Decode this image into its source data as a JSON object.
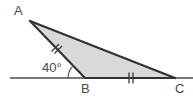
{
  "figure": {
    "kind": "geometry-diagram",
    "shape": "triangle",
    "width": 193,
    "height": 102,
    "background_color": "#ffffff",
    "fill_color": "#d9d9d9",
    "stroke_color": "#333333",
    "baseline_color": "#4d4d4d",
    "label_color": "#4a4a4a"
  },
  "labels": {
    "vertex_a": "A",
    "vertex_b": "B",
    "vertex_c": "C",
    "angle_b": "40°"
  },
  "vertices": {
    "a": {
      "x": 30,
      "y": 21
    },
    "b": {
      "x": 85,
      "y": 78
    },
    "c": {
      "x": 175,
      "y": 78
    }
  },
  "baseline": {
    "name": "horizontal-ray",
    "x_start": 10,
    "x_end": 193,
    "y": 78
  },
  "angle_arc": {
    "at_vertex": "B",
    "value": "40°",
    "radius": 17
  },
  "tick_marks": [
    {
      "name": "tick-ab",
      "on_segment": "AB",
      "count": 2,
      "x": 56,
      "y": 47
    },
    {
      "name": "tick-bc",
      "on_segment": "BC",
      "count": 2,
      "x": 131,
      "y": 78
    }
  ]
}
